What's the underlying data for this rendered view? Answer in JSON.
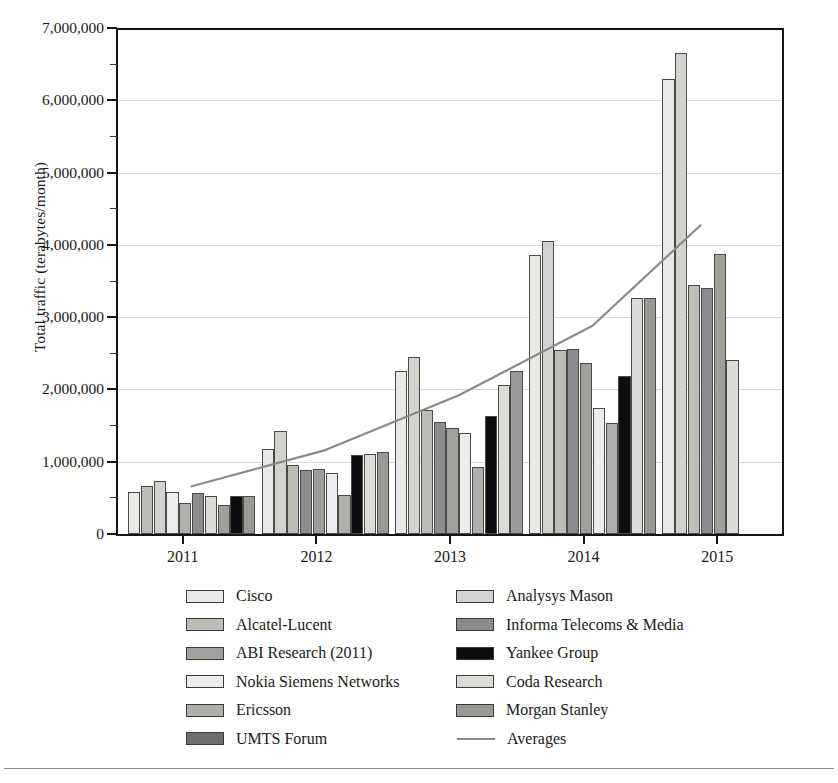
{
  "chart_data": {
    "type": "bar",
    "title": "",
    "subtitle": "",
    "xlabel": "",
    "ylabel": "Total traffic (terabytes/month)",
    "categories": [
      "2011",
      "2012",
      "2013",
      "2014",
      "2015"
    ],
    "ylim": [
      0,
      7000000
    ],
    "yticks": [
      0,
      1000000,
      2000000,
      3000000,
      4000000,
      5000000,
      6000000,
      7000000
    ],
    "ytick_labels": [
      "0",
      "1,000,000",
      "2,000,000",
      "3,000,000",
      "4,000,000",
      "5,000,000",
      "6,000,000",
      "7,000,000"
    ],
    "grid": true,
    "legend_position": "below",
    "series": [
      {
        "name": "Cisco",
        "color": "#e8e8e4",
        "values": [
          580000,
          1170000,
          2250000,
          3860000,
          6300000
        ]
      },
      {
        "name": "Analysys Mason",
        "color": "#d3d3cd",
        "values": [
          660000,
          1420000,
          2450000,
          4050000,
          6660000
        ]
      },
      {
        "name": "Alcatel-Lucent",
        "color": "#bdbdb6",
        "values": [
          740000,
          960000,
          1710000,
          2550000,
          3440000
        ]
      },
      {
        "name": "Informa Telecoms & Media",
        "color": "#8c8c8c",
        "values": [
          580000,
          880000,
          1550000,
          2560000,
          3400000
        ]
      },
      {
        "name": "ABI Research (2011)",
        "color": "#a0a09a",
        "values": [
          430000,
          900000,
          1470000,
          2360000,
          3880000
        ]
      },
      {
        "name": "Yankee Group",
        "color": "#0d0d0d",
        "values": [
          530000,
          1090000,
          1630000,
          2190000,
          null
        ]
      },
      {
        "name": "Nokia Siemens Networks",
        "color": "#ececea",
        "values": [
          570000,
          840000,
          2060000,
          1740000,
          3800000
        ]
      },
      {
        "name": "Coda Research",
        "color": "#dcdcd6",
        "values": [
          580000,
          1110000,
          2260000,
          3270000,
          2410000
        ]
      },
      {
        "name": "Ericsson",
        "color": "#b0b0aa",
        "values": [
          400000,
          540000,
          930000,
          1530000,
          null
        ]
      },
      {
        "name": "Morgan Stanley",
        "color": "#9a9a94",
        "values": [
          530000,
          1130000,
          2240000,
          3260000,
          null
        ]
      },
      {
        "name": "UMTS Forum",
        "color": "#6e6e6e",
        "values": [
          null,
          null,
          null,
          null,
          null
        ]
      }
    ],
    "trend_line": {
      "name": "Averages",
      "color": "#8a8a8a",
      "x": [
        "2011",
        "2012",
        "2013",
        "2014",
        "2015"
      ],
      "values": [
        660000,
        1160000,
        1920000,
        2880000,
        4270000
      ]
    }
  },
  "axis": {
    "y_title": "Total traffic (terabytes/month)",
    "y_ticks": [
      {
        "label": "7,000,000",
        "value": 7000000
      },
      {
        "label": "6,000,000",
        "value": 6000000
      },
      {
        "label": "5,000,000",
        "value": 5000000
      },
      {
        "label": "4,000,000",
        "value": 4000000
      },
      {
        "label": "3,000,000",
        "value": 3000000
      },
      {
        "label": "2,000,000",
        "value": 2000000
      },
      {
        "label": "1,000,000",
        "value": 1000000
      },
      {
        "label": "0",
        "value": 0
      }
    ],
    "x_ticks": [
      {
        "label": "2011"
      },
      {
        "label": "2012"
      },
      {
        "label": "2013"
      },
      {
        "label": "2014"
      },
      {
        "label": "2015"
      }
    ]
  },
  "legend": {
    "left_column": [
      {
        "label": "Cisco",
        "color": "#e8e8e4",
        "kind": "swatch"
      },
      {
        "label": "Alcatel-Lucent",
        "color": "#bdbdb6",
        "kind": "swatch"
      },
      {
        "label": "ABI Research (2011)",
        "color": "#a0a09a",
        "kind": "swatch"
      },
      {
        "label": "Nokia Siemens Networks",
        "color": "#ececea",
        "kind": "swatch"
      },
      {
        "label": "Ericsson",
        "color": "#b0b0aa",
        "kind": "swatch"
      },
      {
        "label": "UMTS Forum",
        "color": "#6e6e6e",
        "kind": "swatch"
      }
    ],
    "right_column": [
      {
        "label": "Analysys Mason",
        "color": "#d3d3cd",
        "kind": "swatch"
      },
      {
        "label": "Informa Telecoms & Media",
        "color": "#8c8c8c",
        "kind": "swatch"
      },
      {
        "label": "Yankee Group",
        "color": "#0d0d0d",
        "kind": "swatch"
      },
      {
        "label": "Coda Research",
        "color": "#dcdcd6",
        "kind": "swatch"
      },
      {
        "label": "Morgan Stanley",
        "color": "#9a9a94",
        "kind": "swatch"
      },
      {
        "label": "Averages",
        "color": "#8a8a8a",
        "kind": "line"
      }
    ]
  },
  "bar_layout": {
    "groups": [
      {
        "category": "2011",
        "bars": [
          {
            "series": "Cisco",
            "value": 580000
          },
          {
            "series": "Alcatel-Lucent",
            "value": 660000
          },
          {
            "series": "Analysys Mason",
            "value": 740000
          },
          {
            "series": "Nokia Siemens Networks",
            "value": 580000
          },
          {
            "series": "Ericsson",
            "value": 430000
          },
          {
            "series": "Informa Telecoms & Media",
            "value": 570000
          },
          {
            "series": "Coda Research",
            "value": 530000
          },
          {
            "series": "ABI Research (2011)",
            "value": 400000
          },
          {
            "series": "Yankee Group",
            "value": 530000
          },
          {
            "series": "Morgan Stanley",
            "value": 530000
          }
        ]
      },
      {
        "category": "2012",
        "bars": [
          {
            "series": "Cisco",
            "value": 1170000
          },
          {
            "series": "Analysys Mason",
            "value": 1420000
          },
          {
            "series": "Alcatel-Lucent",
            "value": 960000
          },
          {
            "series": "Informa Telecoms & Media",
            "value": 880000
          },
          {
            "series": "ABI Research (2011)",
            "value": 900000
          },
          {
            "series": "Nokia Siemens Networks",
            "value": 840000
          },
          {
            "series": "Ericsson",
            "value": 540000
          },
          {
            "series": "Yankee Group",
            "value": 1090000
          },
          {
            "series": "Coda Research",
            "value": 1110000
          },
          {
            "series": "Morgan Stanley",
            "value": 1130000
          }
        ]
      },
      {
        "category": "2013",
        "bars": [
          {
            "series": "Cisco",
            "value": 2250000
          },
          {
            "series": "Analysys Mason",
            "value": 2450000
          },
          {
            "series": "Alcatel-Lucent",
            "value": 1710000
          },
          {
            "series": "Informa Telecoms & Media",
            "value": 1550000
          },
          {
            "series": "ABI Research (2011)",
            "value": 1470000
          },
          {
            "series": "Nokia Siemens Networks",
            "value": 1400000
          },
          {
            "series": "Ericsson",
            "value": 930000
          },
          {
            "series": "Yankee Group",
            "value": 1630000
          },
          {
            "series": "Coda Research",
            "value": 2060000
          },
          {
            "series": "Morgan Stanley",
            "value": 2260000
          }
        ]
      },
      {
        "category": "2014",
        "bars": [
          {
            "series": "Cisco",
            "value": 3860000
          },
          {
            "series": "Analysys Mason",
            "value": 4050000
          },
          {
            "series": "Alcatel-Lucent",
            "value": 2550000
          },
          {
            "series": "Informa Telecoms & Media",
            "value": 2560000
          },
          {
            "series": "ABI Research (2011)",
            "value": 2360000
          },
          {
            "series": "Nokia Siemens Networks",
            "value": 1740000
          },
          {
            "series": "Ericsson",
            "value": 1530000
          },
          {
            "series": "Yankee Group",
            "value": 2190000
          },
          {
            "series": "Coda Research",
            "value": 3270000
          },
          {
            "series": "Morgan Stanley",
            "value": 3260000
          }
        ]
      },
      {
        "category": "2015",
        "bars": [
          {
            "series": "Cisco",
            "value": 6300000
          },
          {
            "series": "Analysys Mason",
            "value": 6660000
          },
          {
            "series": "Alcatel-Lucent",
            "value": 3440000
          },
          {
            "series": "Informa Telecoms & Media",
            "value": 3400000
          },
          {
            "series": "ABI Research (2011)",
            "value": 3880000
          },
          {
            "series": "Coda Research",
            "value": 2410000
          }
        ]
      }
    ]
  }
}
